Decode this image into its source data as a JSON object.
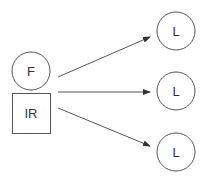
{
  "diagram": {
    "nodes": [
      {
        "id": "F",
        "label": "F",
        "shape": "circle"
      },
      {
        "id": "IR",
        "label": "IR",
        "shape": "square"
      },
      {
        "id": "L1",
        "label": "L",
        "shape": "circle"
      },
      {
        "id": "L2",
        "label": "L",
        "shape": "circle"
      },
      {
        "id": "L3",
        "label": "L",
        "shape": "circle"
      }
    ],
    "edges": [
      {
        "from": "F/IR",
        "to": "L1"
      },
      {
        "from": "F/IR",
        "to": "L2"
      },
      {
        "from": "F/IR",
        "to": "L3"
      }
    ],
    "colors": {
      "stroke": "#555555",
      "text": "#333333",
      "background": "#ffffff"
    }
  }
}
